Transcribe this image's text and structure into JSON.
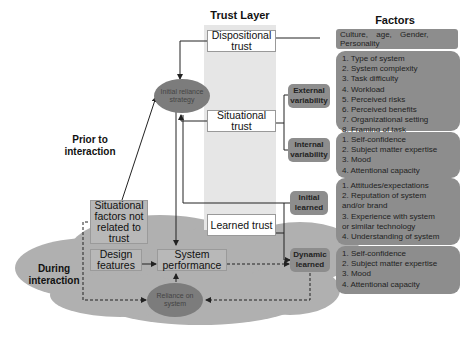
{
  "headings": {
    "trust_layer": "Trust Layer",
    "factors": "Factors"
  },
  "phases": {
    "prior": "Prior to interaction",
    "during": "During interaction"
  },
  "trust_boxes": {
    "dispositional": "Dispositional trust",
    "situational": "Situational trust",
    "learned": "Learned trust"
  },
  "ellipses": {
    "initial_reliance": "Initial reliance strategy",
    "reliance_on_system": "Reliance on system"
  },
  "grey_boxes": {
    "situational_factors": "Situational factors not related to trust",
    "design_features": "Design features",
    "system_performance": "System performance"
  },
  "tags": {
    "external": "External variability",
    "internal": "Internal variability",
    "initial_learned": "Initial learned",
    "dynamic_learned": "Dynamic learned"
  },
  "factors": {
    "dispositional": "Culture,    age,    Gender, Personality",
    "external": [
      "1. Type of system",
      "2. System complexity",
      "3. Task difficulty",
      "4. Workload",
      "5. Perceived risks",
      "6. Perceived benefits",
      "7. Organizational setting",
      "8. Framing of task"
    ],
    "internal": [
      "1. Self-confidence",
      "2. Subject matter expertise",
      "3. Mood",
      "4. Attentional capacity"
    ],
    "initial_learned": [
      "1. Attitudes/expectations",
      "2. Reputation of system",
      "and/or brand",
      "3. Experience with system",
      "or similar technology",
      "4. Understanding of system"
    ],
    "dynamic_learned": [
      "1. Self-confidence",
      "2. Subject matter expertise",
      "3. Mood",
      "4. Attentional capacity"
    ]
  },
  "colors": {
    "cloud": "#b0b0b0",
    "trust_layer_bg": "#e6e6e6",
    "factor_box": "#8d8d8d",
    "ellipse": "#7c7c7c",
    "grey_box": "#b8b8b8"
  }
}
